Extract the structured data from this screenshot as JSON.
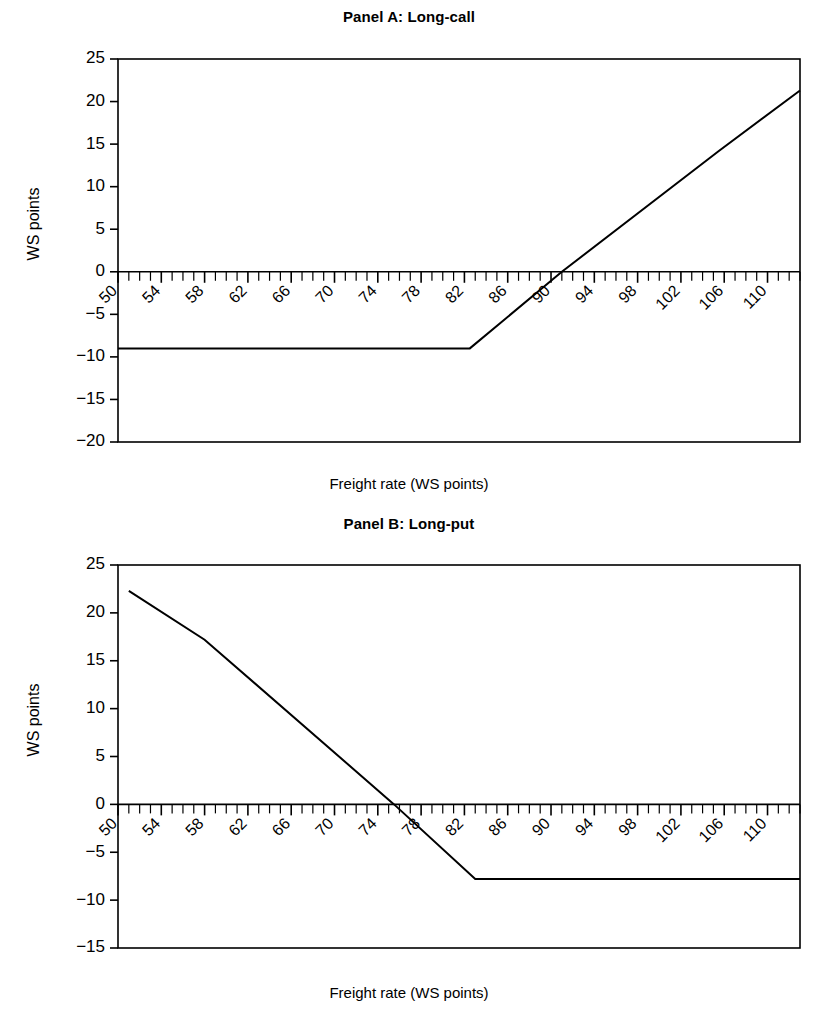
{
  "chart_data": [
    {
      "type": "line",
      "panel_id": "A",
      "title": "Panel A: Long-call",
      "xlabel": "Freight rate (WS points)",
      "ylabel": "WS points",
      "xlim": [
        50,
        113
      ],
      "ylim": [
        -20,
        25
      ],
      "yticks": [
        25,
        20,
        15,
        10,
        5,
        0,
        -5,
        -10,
        -15,
        -20
      ],
      "ytick_labels": [
        "25",
        "20",
        "15",
        "10",
        "5",
        "0",
        "−5",
        "−10",
        "−15",
        "−20"
      ],
      "xticks": [
        50,
        54,
        58,
        62,
        66,
        70,
        74,
        78,
        82,
        86,
        90,
        94,
        98,
        102,
        106,
        110
      ],
      "xtick_labels": [
        "50",
        "54",
        "58",
        "62",
        "66",
        "70",
        "74",
        "78",
        "82",
        "86",
        "90",
        "94",
        "98",
        "102",
        "106",
        "110"
      ],
      "x_minor_tick_step": 1,
      "xtick_label_rotation": -45,
      "grid": false,
      "legend": "none",
      "series": [
        {
          "name": "Long-call payoff",
          "color": "#000000",
          "x": [
            50,
            82.5,
            91.0,
            105.5,
            113.0
          ],
          "y": [
            -9.0,
            -9.0,
            0.0,
            14.2,
            21.3
          ]
        }
      ],
      "annotations": {
        "flat_level": -9.0,
        "strike_kink_x": 82.5,
        "breakeven_x": 91.0,
        "max_value": 21.3,
        "slope_change_x": 105.5
      }
    },
    {
      "type": "line",
      "panel_id": "B",
      "title": "Panel B: Long-put",
      "xlabel": "Freight rate (WS points)",
      "ylabel": "WS points",
      "xlim": [
        50,
        113
      ],
      "ylim": [
        -15,
        25
      ],
      "yticks": [
        25,
        20,
        15,
        10,
        5,
        0,
        -5,
        -10,
        -15
      ],
      "ytick_labels": [
        "25",
        "20",
        "15",
        "10",
        "5",
        "0",
        "−5",
        "−10",
        "−15"
      ],
      "xticks": [
        50,
        54,
        58,
        62,
        66,
        70,
        74,
        78,
        82,
        86,
        90,
        94,
        98,
        102,
        106,
        110
      ],
      "xtick_labels": [
        "50",
        "54",
        "58",
        "62",
        "66",
        "70",
        "74",
        "78",
        "82",
        "86",
        "90",
        "94",
        "98",
        "102",
        "106",
        "110"
      ],
      "x_minor_tick_step": 1,
      "xtick_label_rotation": -45,
      "grid": false,
      "legend": "none",
      "series": [
        {
          "name": "Long-put payoff",
          "color": "#000000",
          "x": [
            51.0,
            58.0,
            75.5,
            83.0,
            113.0
          ],
          "y": [
            22.3,
            17.2,
            0.0,
            -7.8,
            -7.8
          ]
        }
      ],
      "annotations": {
        "flat_level": -7.8,
        "strike_kink_x": 83.0,
        "breakeven_x": 75.5,
        "max_value": 22.3,
        "slope_change_x": 58.0
      }
    }
  ],
  "panel_a": {
    "title": "Panel A: Long-call",
    "xlabel": "Freight rate (WS points)",
    "ylabel": "WS points"
  },
  "panel_b": {
    "title": "Panel B: Long-put",
    "xlabel": "Freight rate (WS points)",
    "ylabel": "WS points"
  }
}
